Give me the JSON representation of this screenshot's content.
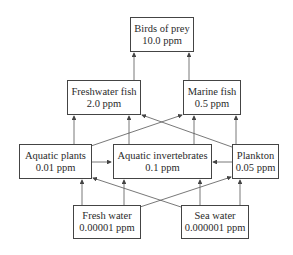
{
  "diagram": {
    "nodes": {
      "birds": {
        "name": "Birds of prey",
        "value": "10.0 ppm"
      },
      "freshfish": {
        "name": "Freshwater fish",
        "value": "2.0 ppm"
      },
      "marinefish": {
        "name": "Marine fish",
        "value": "0.5 ppm"
      },
      "plants": {
        "name": "Aquatic plants",
        "value": "0.01 ppm"
      },
      "inverts": {
        "name": "Aquatic invertebrates",
        "value": "0.1 ppm"
      },
      "plankton": {
        "name": "Plankton",
        "value": "0.05 ppm"
      },
      "freshwater": {
        "name": "Fresh water",
        "value": "0.00001 ppm"
      },
      "seawater": {
        "name": "Sea water",
        "value": "0.000001 ppm"
      }
    },
    "edges": [
      [
        "Freshwater fish",
        "Birds of prey"
      ],
      [
        "Marine fish",
        "Birds of prey"
      ],
      [
        "Aquatic plants",
        "Freshwater fish"
      ],
      [
        "Aquatic invertebrates",
        "Freshwater fish"
      ],
      [
        "Plankton",
        "Freshwater fish"
      ],
      [
        "Aquatic plants",
        "Marine fish"
      ],
      [
        "Aquatic invertebrates",
        "Marine fish"
      ],
      [
        "Plankton",
        "Marine fish"
      ],
      [
        "Aquatic plants",
        "Aquatic invertebrates"
      ],
      [
        "Plankton",
        "Aquatic invertebrates"
      ],
      [
        "Fresh water",
        "Aquatic plants"
      ],
      [
        "Fresh water",
        "Aquatic invertebrates"
      ],
      [
        "Fresh water",
        "Plankton"
      ],
      [
        "Sea water",
        "Aquatic plants"
      ],
      [
        "Sea water",
        "Aquatic invertebrates"
      ],
      [
        "Sea water",
        "Plankton"
      ]
    ]
  }
}
